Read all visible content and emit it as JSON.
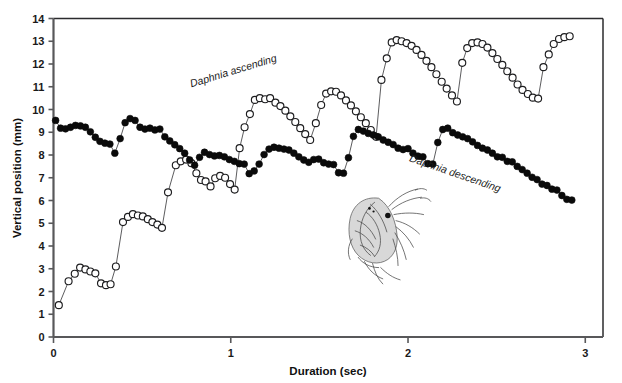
{
  "figure": {
    "background": "#ffffff",
    "frame_color": "#2b2b2d",
    "axis_color": "#58585a"
  },
  "chart_data": {
    "type": "scatter",
    "title": "",
    "xlabel": "Duration (sec)",
    "ylabel": "Vertical position (mm)",
    "xlim": [
      0,
      3.1
    ],
    "ylim": [
      0,
      14
    ],
    "xticks": [
      0,
      1,
      2,
      3
    ],
    "xticklabels": [
      "0",
      "1",
      "2",
      "3"
    ],
    "yticks": [
      0,
      1,
      2,
      3,
      4,
      5,
      6,
      7,
      8,
      9,
      10,
      11,
      12,
      13,
      14
    ],
    "yticklabels": [
      "0",
      "1",
      "2",
      "3",
      "4",
      "5",
      "6",
      "7",
      "8",
      "9",
      "10",
      "11",
      "12",
      "13",
      "14"
    ],
    "grid": false,
    "legend_position": "inline-annotation",
    "annotations": [
      {
        "text": "Daphnia ascending",
        "x": 1.02,
        "y": 11.55,
        "rotation": -17,
        "style": "italic"
      },
      {
        "text": "Daphnia descending",
        "x": 2.26,
        "y": 7.05,
        "rotation": 19,
        "style": "italic"
      }
    ],
    "series": [
      {
        "name": "Daphnia ascending",
        "marker": "open-circle",
        "marker_face": "#ffffff",
        "marker_edge": "#1d1d1f",
        "line_color": "#4a4a4c",
        "points": [
          [
            0.03,
            1.4
          ],
          [
            0.085,
            2.45
          ],
          [
            0.12,
            2.78
          ],
          [
            0.15,
            3.05
          ],
          [
            0.18,
            2.97
          ],
          [
            0.208,
            2.88
          ],
          [
            0.236,
            2.8
          ],
          [
            0.268,
            2.36
          ],
          [
            0.296,
            2.28
          ],
          [
            0.322,
            2.32
          ],
          [
            0.352,
            3.1
          ],
          [
            0.392,
            5.05
          ],
          [
            0.42,
            5.28
          ],
          [
            0.448,
            5.4
          ],
          [
            0.476,
            5.34
          ],
          [
            0.504,
            5.3
          ],
          [
            0.532,
            5.18
          ],
          [
            0.558,
            5.05
          ],
          [
            0.586,
            4.94
          ],
          [
            0.612,
            4.8
          ],
          [
            0.646,
            6.36
          ],
          [
            0.69,
            7.55
          ],
          [
            0.718,
            7.72
          ],
          [
            0.748,
            7.8
          ],
          [
            0.778,
            7.64
          ],
          [
            0.806,
            7.2
          ],
          [
            0.832,
            6.9
          ],
          [
            0.858,
            6.84
          ],
          [
            0.886,
            6.62
          ],
          [
            0.912,
            6.98
          ],
          [
            0.94,
            7.08
          ],
          [
            0.968,
            7.0
          ],
          [
            0.996,
            6.72
          ],
          [
            1.022,
            6.48
          ],
          [
            1.05,
            8.3
          ],
          [
            1.078,
            9.22
          ],
          [
            1.108,
            9.8
          ],
          [
            1.136,
            10.42
          ],
          [
            1.164,
            10.5
          ],
          [
            1.194,
            10.45
          ],
          [
            1.222,
            10.5
          ],
          [
            1.252,
            10.3
          ],
          [
            1.28,
            10.15
          ],
          [
            1.308,
            9.95
          ],
          [
            1.336,
            9.7
          ],
          [
            1.364,
            9.45
          ],
          [
            1.392,
            9.18
          ],
          [
            1.42,
            8.92
          ],
          [
            1.448,
            8.66
          ],
          [
            1.48,
            9.4
          ],
          [
            1.51,
            10.2
          ],
          [
            1.538,
            10.7
          ],
          [
            1.566,
            10.8
          ],
          [
            1.594,
            10.78
          ],
          [
            1.622,
            10.62
          ],
          [
            1.65,
            10.4
          ],
          [
            1.678,
            10.18
          ],
          [
            1.706,
            9.92
          ],
          [
            1.734,
            9.66
          ],
          [
            1.762,
            9.4
          ],
          [
            1.79,
            9.1
          ],
          [
            1.82,
            8.8
          ],
          [
            1.85,
            11.3
          ],
          [
            1.88,
            12.25
          ],
          [
            1.908,
            12.95
          ],
          [
            1.936,
            13.05
          ],
          [
            1.964,
            13.0
          ],
          [
            1.992,
            12.92
          ],
          [
            2.02,
            12.8
          ],
          [
            2.048,
            12.62
          ],
          [
            2.076,
            12.4
          ],
          [
            2.104,
            12.14
          ],
          [
            2.132,
            11.86
          ],
          [
            2.16,
            11.55
          ],
          [
            2.19,
            11.22
          ],
          [
            2.218,
            10.92
          ],
          [
            2.248,
            10.62
          ],
          [
            2.276,
            10.35
          ],
          [
            2.306,
            12.05
          ],
          [
            2.334,
            12.7
          ],
          [
            2.362,
            12.92
          ],
          [
            2.392,
            12.95
          ],
          [
            2.42,
            12.88
          ],
          [
            2.448,
            12.72
          ],
          [
            2.476,
            12.48
          ],
          [
            2.504,
            12.22
          ],
          [
            2.532,
            11.96
          ],
          [
            2.56,
            11.68
          ],
          [
            2.59,
            11.4
          ],
          [
            2.618,
            11.1
          ],
          [
            2.646,
            10.86
          ],
          [
            2.676,
            10.68
          ],
          [
            2.704,
            10.52
          ],
          [
            2.734,
            10.48
          ],
          [
            2.764,
            11.86
          ],
          [
            2.794,
            12.42
          ],
          [
            2.822,
            12.88
          ],
          [
            2.852,
            13.1
          ],
          [
            2.882,
            13.18
          ],
          [
            2.912,
            13.22
          ]
        ]
      },
      {
        "name": "Daphnia descending",
        "marker": "filled-circle",
        "marker_face": "#0a0a0a",
        "marker_edge": "#0a0a0a",
        "line_color": "#4a4a4c",
        "points": [
          [
            0.012,
            9.52
          ],
          [
            0.04,
            9.18
          ],
          [
            0.068,
            9.15
          ],
          [
            0.096,
            9.22
          ],
          [
            0.124,
            9.3
          ],
          [
            0.152,
            9.28
          ],
          [
            0.18,
            9.22
          ],
          [
            0.208,
            9.02
          ],
          [
            0.236,
            8.78
          ],
          [
            0.262,
            8.6
          ],
          [
            0.29,
            8.52
          ],
          [
            0.318,
            8.48
          ],
          [
            0.346,
            8.08
          ],
          [
            0.376,
            8.72
          ],
          [
            0.404,
            9.42
          ],
          [
            0.432,
            9.6
          ],
          [
            0.46,
            9.52
          ],
          [
            0.488,
            9.22
          ],
          [
            0.516,
            9.14
          ],
          [
            0.544,
            9.18
          ],
          [
            0.572,
            9.1
          ],
          [
            0.6,
            9.14
          ],
          [
            0.628,
            8.8
          ],
          [
            0.656,
            8.62
          ],
          [
            0.684,
            8.45
          ],
          [
            0.712,
            8.28
          ],
          [
            0.74,
            8.08
          ],
          [
            0.768,
            7.78
          ],
          [
            0.796,
            7.55
          ],
          [
            0.824,
            7.9
          ],
          [
            0.852,
            8.12
          ],
          [
            0.88,
            8.02
          ],
          [
            0.908,
            7.96
          ],
          [
            0.936,
            7.98
          ],
          [
            0.964,
            7.92
          ],
          [
            0.992,
            7.8
          ],
          [
            1.02,
            7.72
          ],
          [
            1.048,
            7.62
          ],
          [
            1.076,
            7.6
          ],
          [
            1.104,
            7.18
          ],
          [
            1.132,
            7.3
          ],
          [
            1.16,
            7.6
          ],
          [
            1.188,
            8.02
          ],
          [
            1.216,
            8.26
          ],
          [
            1.244,
            8.34
          ],
          [
            1.272,
            8.3
          ],
          [
            1.3,
            8.26
          ],
          [
            1.328,
            8.22
          ],
          [
            1.356,
            8.08
          ],
          [
            1.384,
            7.92
          ],
          [
            1.412,
            7.78
          ],
          [
            1.44,
            7.68
          ],
          [
            1.468,
            7.8
          ],
          [
            1.496,
            7.82
          ],
          [
            1.524,
            7.66
          ],
          [
            1.552,
            7.6
          ],
          [
            1.58,
            7.58
          ],
          [
            1.608,
            7.22
          ],
          [
            1.636,
            7.2
          ],
          [
            1.664,
            7.88
          ],
          [
            1.692,
            8.82
          ],
          [
            1.72,
            9.12
          ],
          [
            1.748,
            9.05
          ],
          [
            1.776,
            8.95
          ],
          [
            1.804,
            8.88
          ],
          [
            1.832,
            8.8
          ],
          [
            1.86,
            8.66
          ],
          [
            1.888,
            8.56
          ],
          [
            1.916,
            8.46
          ],
          [
            1.944,
            8.3
          ],
          [
            1.972,
            8.24
          ],
          [
            2.0,
            8.28
          ],
          [
            2.028,
            8.08
          ],
          [
            2.056,
            7.95
          ],
          [
            2.084,
            7.92
          ],
          [
            2.112,
            7.62
          ],
          [
            2.14,
            7.6
          ],
          [
            2.168,
            8.55
          ],
          [
            2.196,
            9.12
          ],
          [
            2.224,
            9.18
          ],
          [
            2.252,
            8.98
          ],
          [
            2.28,
            8.88
          ],
          [
            2.308,
            8.8
          ],
          [
            2.336,
            8.72
          ],
          [
            2.364,
            8.58
          ],
          [
            2.392,
            8.42
          ],
          [
            2.42,
            8.3
          ],
          [
            2.448,
            8.22
          ],
          [
            2.476,
            8.08
          ],
          [
            2.504,
            7.92
          ],
          [
            2.532,
            7.9
          ],
          [
            2.56,
            7.72
          ],
          [
            2.588,
            7.7
          ],
          [
            2.616,
            7.5
          ],
          [
            2.644,
            7.36
          ],
          [
            2.672,
            7.2
          ],
          [
            2.7,
            7.02
          ],
          [
            2.728,
            6.92
          ],
          [
            2.756,
            6.72
          ],
          [
            2.784,
            6.66
          ],
          [
            2.812,
            6.5
          ],
          [
            2.84,
            6.46
          ],
          [
            2.868,
            6.22
          ],
          [
            2.896,
            6.05
          ],
          [
            2.924,
            6.02
          ]
        ]
      }
    ]
  },
  "illustration": {
    "name": "daphnia-drawing",
    "caption": ""
  }
}
